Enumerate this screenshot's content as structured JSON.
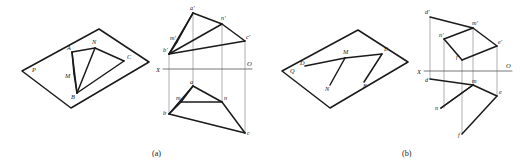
{
  "figure": {
    "captions": [
      {
        "id": "caption-a",
        "text": "(a)",
        "x": 152,
        "y": 156
      },
      {
        "id": "caption-b",
        "text": "(b)",
        "x": 402,
        "y": 156
      }
    ],
    "axis_labels": {
      "x_left": "X",
      "o_right": "O"
    },
    "panel_a": {
      "pictorial": {
        "plane_label": "P",
        "plane_label_pos": {
          "x": 32,
          "y": 72
        },
        "parallelogram": [
          {
            "x": 22,
            "y": 71
          },
          {
            "x": 99,
            "y": 29
          },
          {
            "x": 149,
            "y": 62
          },
          {
            "x": 71,
            "y": 108
          }
        ],
        "points": [
          {
            "name": "A",
            "label": "A",
            "x": 72,
            "y": 52,
            "lx": 67,
            "ly": 50
          },
          {
            "name": "N",
            "label": "N",
            "x": 95,
            "y": 48,
            "lx": 92,
            "ly": 44
          },
          {
            "name": "C",
            "label": "C",
            "x": 124,
            "y": 61,
            "lx": 127,
            "ly": 59
          },
          {
            "name": "M",
            "label": "M",
            "x": 74,
            "y": 74,
            "lx": 65,
            "ly": 78
          },
          {
            "name": "B",
            "label": "B",
            "x": 77,
            "y": 93,
            "lx": 71,
            "ly": 99
          }
        ],
        "edges": [
          [
            "A",
            "N"
          ],
          [
            "N",
            "C"
          ],
          [
            "C",
            "B"
          ],
          [
            "B",
            "A"
          ],
          [
            "B",
            "N"
          ],
          [
            "A",
            "M"
          ],
          [
            "M",
            "B"
          ]
        ]
      },
      "projection": {
        "axis": {
          "x1": 163,
          "y1": 69,
          "x2": 252,
          "y2": 69
        },
        "x_label_pos": {
          "x": 156,
          "y": 72
        },
        "o_label_pos": {
          "x": 247,
          "y": 66
        },
        "upper_points": [
          {
            "name": "a1",
            "label": "a'",
            "x": 193,
            "y": 13,
            "lx": 190,
            "ly": 10
          },
          {
            "name": "n1",
            "label": "n'",
            "x": 222,
            "y": 24,
            "lx": 221,
            "ly": 20
          },
          {
            "name": "c1",
            "label": "c'",
            "x": 245,
            "y": 41,
            "lx": 246,
            "ly": 39
          },
          {
            "name": "m1",
            "label": "m'",
            "x": 177,
            "y": 42,
            "lx": 170,
            "ly": 40
          },
          {
            "name": "b1",
            "label": "b'",
            "x": 169,
            "y": 54,
            "lx": 163,
            "ly": 52
          }
        ],
        "upper_edges": [
          [
            "a1",
            "n1"
          ],
          [
            "n1",
            "c1"
          ],
          [
            "c1",
            "b1"
          ],
          [
            "b1",
            "a1"
          ],
          [
            "b1",
            "n1"
          ],
          [
            "a1",
            "m1"
          ],
          [
            "m1",
            "b1"
          ]
        ],
        "lower_points": [
          {
            "name": "a2",
            "label": "a",
            "x": 193,
            "y": 86,
            "lx": 190,
            "ly": 84
          },
          {
            "name": "n2",
            "label": "n",
            "x": 222,
            "y": 102,
            "lx": 224,
            "ly": 100
          },
          {
            "name": "c2",
            "label": "c",
            "x": 245,
            "y": 133,
            "lx": 247,
            "ly": 135
          },
          {
            "name": "m2",
            "label": "m",
            "x": 181,
            "y": 102,
            "lx": 176,
            "ly": 100
          },
          {
            "name": "b2",
            "label": "b",
            "x": 169,
            "y": 114,
            "lx": 163,
            "ly": 115
          }
        ],
        "lower_edges": [
          [
            "a2",
            "n2"
          ],
          [
            "n2",
            "c2"
          ],
          [
            "c2",
            "b2"
          ],
          [
            "b2",
            "a2"
          ],
          [
            "a2",
            "m2"
          ],
          [
            "m2",
            "b2"
          ],
          [
            "m2",
            "n2"
          ]
        ],
        "connectors": [
          {
            "x": 193,
            "y1": 13,
            "y2": 86
          },
          {
            "x": 222,
            "y1": 24,
            "y2": 102
          },
          {
            "x": 245,
            "y1": 41,
            "y2": 133
          },
          {
            "x": 169,
            "y1": 54,
            "y2": 114
          }
        ]
      }
    },
    "panel_b": {
      "pictorial": {
        "plane_label": "Q",
        "plane_label_pos": {
          "x": 290,
          "y": 73
        },
        "parallelogram": [
          {
            "x": 282,
            "y": 71
          },
          {
            "x": 358,
            "y": 30
          },
          {
            "x": 408,
            "y": 62
          },
          {
            "x": 330,
            "y": 108
          }
        ],
        "points": [
          {
            "name": "D",
            "label": "D",
            "x": 305,
            "y": 66,
            "lx": 300,
            "ly": 65
          },
          {
            "name": "M",
            "label": "M",
            "x": 345,
            "y": 58,
            "lx": 343,
            "ly": 54
          },
          {
            "name": "E",
            "label": "E",
            "x": 382,
            "y": 54,
            "lx": 384,
            "ly": 51
          },
          {
            "name": "N",
            "label": "N",
            "x": 330,
            "y": 85,
            "lx": 325,
            "ly": 91
          },
          {
            "name": "F",
            "label": "F",
            "x": 364,
            "y": 82,
            "lx": 363,
            "ly": 88
          }
        ],
        "edges": [
          [
            "D",
            "M"
          ],
          [
            "M",
            "E"
          ],
          [
            "M",
            "N"
          ],
          [
            "E",
            "F"
          ]
        ]
      },
      "projection": {
        "axis": {
          "x1": 424,
          "y1": 71,
          "x2": 512,
          "y2": 71
        },
        "x_label_pos": {
          "x": 417,
          "y": 74
        },
        "o_label_pos": {
          "x": 506,
          "y": 68
        },
        "upper_points": [
          {
            "name": "d1",
            "label": "d'",
            "x": 430,
            "y": 17,
            "lx": 425,
            "ly": 14
          },
          {
            "name": "m1",
            "label": "m'",
            "x": 473,
            "y": 28,
            "lx": 472,
            "ly": 25
          },
          {
            "name": "n1",
            "label": "n'",
            "x": 444,
            "y": 39,
            "lx": 439,
            "ly": 37
          },
          {
            "name": "e1",
            "label": "e'",
            "x": 497,
            "y": 46,
            "lx": 498,
            "ly": 44
          },
          {
            "name": "f1",
            "label": "f'",
            "x": 462,
            "y": 60,
            "lx": 456,
            "ly": 59
          }
        ],
        "upper_edges": [
          [
            "d1",
            "m1"
          ],
          [
            "m1",
            "n1"
          ],
          [
            "n1",
            "f1"
          ],
          [
            "m1",
            "e1"
          ],
          [
            "e1",
            "f1"
          ]
        ],
        "lower_points": [
          {
            "name": "d2",
            "label": "d",
            "x": 430,
            "y": 79,
            "lx": 425,
            "ly": 82
          },
          {
            "name": "m2",
            "label": "m",
            "x": 473,
            "y": 85,
            "lx": 472,
            "ly": 83
          },
          {
            "name": "e2",
            "label": "e",
            "x": 497,
            "y": 96,
            "lx": 499,
            "ly": 94
          },
          {
            "name": "n2",
            "label": "n",
            "x": 441,
            "y": 108,
            "lx": 435,
            "ly": 110
          },
          {
            "name": "f2",
            "label": "f",
            "x": 462,
            "y": 134,
            "lx": 458,
            "ly": 137
          }
        ],
        "lower_edges": [
          [
            "d2",
            "m2"
          ],
          [
            "m2",
            "n2"
          ],
          [
            "m2",
            "e2"
          ],
          [
            "e2",
            "f2"
          ],
          [
            "n2",
            "m2"
          ]
        ],
        "connectors": [
          {
            "x": 430,
            "y1": 17,
            "y2": 79
          },
          {
            "x": 473,
            "y1": 28,
            "y2": 85
          },
          {
            "x": 497,
            "y1": 46,
            "y2": 96
          },
          {
            "x": 444,
            "y1": 39,
            "y2": 108
          },
          {
            "x": 462,
            "y1": 60,
            "y2": 134
          }
        ]
      }
    }
  },
  "colors": {
    "line": "#1a1a1a",
    "thin_line": "#7a7a7a",
    "background": "#ffffff"
  }
}
